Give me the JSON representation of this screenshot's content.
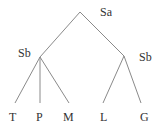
{
  "diagram": {
    "type": "tree",
    "colors": {
      "edge": "#8a8a8a",
      "text": "#333333",
      "background": "#ffffff"
    },
    "nodes": [
      {
        "id": "root",
        "label": "Sa",
        "x": 80,
        "y": 12,
        "label_x": 100,
        "label_y": 16
      },
      {
        "id": "left",
        "label": "Sb",
        "x": 40,
        "y": 57,
        "label_x": 18,
        "label_y": 57
      },
      {
        "id": "right",
        "label": "Sb",
        "x": 124,
        "y": 56,
        "label_x": 139,
        "label_y": 61
      }
    ],
    "leaves": [
      {
        "id": "T",
        "label": "T",
        "x": 15,
        "y": 103,
        "label_x": 9,
        "label_y": 121
      },
      {
        "id": "P",
        "label": "P",
        "x": 40,
        "y": 103,
        "label_x": 36,
        "label_y": 121
      },
      {
        "id": "M",
        "label": "M",
        "x": 69,
        "y": 103,
        "label_x": 63,
        "label_y": 121
      },
      {
        "id": "L",
        "label": "L",
        "x": 103,
        "y": 103,
        "label_x": 100,
        "label_y": 121
      },
      {
        "id": "G",
        "label": "G",
        "x": 141,
        "y": 103,
        "label_x": 140,
        "label_y": 121
      }
    ],
    "edges": [
      [
        "root",
        "left"
      ],
      [
        "root",
        "right"
      ],
      [
        "left",
        "T"
      ],
      [
        "left",
        "P"
      ],
      [
        "left",
        "M"
      ],
      [
        "right",
        "L"
      ],
      [
        "right",
        "G"
      ]
    ]
  }
}
